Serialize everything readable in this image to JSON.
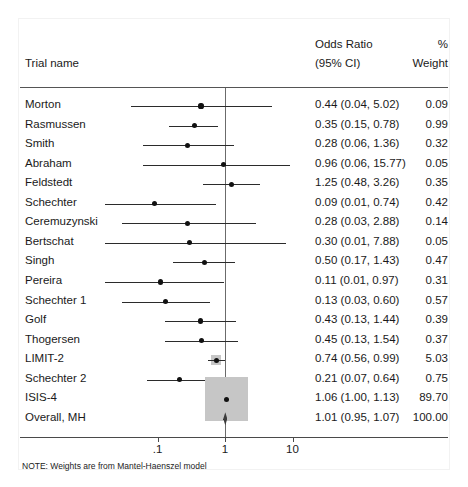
{
  "header": {
    "trial_name": "Trial name",
    "odds_ratio_line1": "Odds Ratio",
    "odds_ratio_line2": "(95% CI)",
    "weight_line1": "%",
    "weight_line2": "Weight"
  },
  "footnote": "NOTE: Weights are from Mantel-Haenszel model",
  "axis": {
    "ticks": [
      {
        "label": ".1",
        "value": 0.1
      },
      {
        "label": "1",
        "value": 1
      },
      {
        "label": "10",
        "value": 10
      }
    ]
  },
  "colors": {
    "marker": "#111111",
    "ci_line": "#2b2b2b",
    "weight_box": "#c6c6c6",
    "null_line": "#6b6b6b",
    "axis": "#4a4a4a",
    "text": "#1a1a1a",
    "background": "#ffffff"
  },
  "chart_data": {
    "type": "forest",
    "title": "",
    "xlabel": "",
    "ylabel": "",
    "xscale": "log",
    "xlim": [
      0.022,
      46
    ],
    "null_value": 1,
    "grid": false,
    "legend": "none",
    "columns": [
      "Trial name",
      "Odds Ratio (95% CI)",
      "% Weight"
    ],
    "rows": [
      {
        "trial": "Morton",
        "or": 0.44,
        "lo": 0.04,
        "hi": 5.02,
        "text": "0.44 (0.04, 5.02)",
        "weight": 0.09,
        "weight_text": "0.09",
        "box": false,
        "diamond": false
      },
      {
        "trial": "Rasmussen",
        "or": 0.35,
        "lo": 0.15,
        "hi": 0.78,
        "text": "0.35 (0.15, 0.78)",
        "weight": 0.99,
        "weight_text": "0.99",
        "box": false,
        "diamond": false
      },
      {
        "trial": "Smith",
        "or": 0.28,
        "lo": 0.06,
        "hi": 1.36,
        "text": "0.28 (0.06, 1.36)",
        "weight": 0.32,
        "weight_text": "0.32",
        "box": false,
        "diamond": false
      },
      {
        "trial": "Abraham",
        "or": 0.96,
        "lo": 0.06,
        "hi": 15.77,
        "text": "0.96 (0.06, 15.77)",
        "weight": 0.05,
        "weight_text": "0.05",
        "box": false,
        "diamond": false
      },
      {
        "trial": "Feldstedt",
        "or": 1.25,
        "lo": 0.48,
        "hi": 3.26,
        "text": "1.25 (0.48, 3.26)",
        "weight": 0.35,
        "weight_text": "0.35",
        "box": false,
        "diamond": false
      },
      {
        "trial": "Schechter",
        "or": 0.09,
        "lo": 0.01,
        "hi": 0.74,
        "text": "0.09 (0.01, 0.74)",
        "weight": 0.42,
        "weight_text": "0.42",
        "box": false,
        "diamond": false
      },
      {
        "trial": "Ceremuzynski",
        "or": 0.28,
        "lo": 0.03,
        "hi": 2.88,
        "text": "0.28 (0.03, 2.88)",
        "weight": 0.14,
        "weight_text": "0.14",
        "box": false,
        "diamond": false
      },
      {
        "trial": "Bertschat",
        "or": 0.3,
        "lo": 0.01,
        "hi": 7.88,
        "text": "0.30 (0.01, 7.88)",
        "weight": 0.05,
        "weight_text": "0.05",
        "box": false,
        "diamond": false
      },
      {
        "trial": "Singh",
        "or": 0.5,
        "lo": 0.17,
        "hi": 1.43,
        "text": "0.50 (0.17, 1.43)",
        "weight": 0.47,
        "weight_text": "0.47",
        "box": false,
        "diamond": false
      },
      {
        "trial": "Pereira",
        "or": 0.11,
        "lo": 0.01,
        "hi": 0.97,
        "text": "0.11 (0.01, 0.97)",
        "weight": 0.31,
        "weight_text": "0.31",
        "box": false,
        "diamond": false
      },
      {
        "trial": "Schechter 1",
        "or": 0.13,
        "lo": 0.03,
        "hi": 0.6,
        "text": "0.13 (0.03, 0.60)",
        "weight": 0.57,
        "weight_text": "0.57",
        "box": false,
        "diamond": false
      },
      {
        "trial": "Golf",
        "or": 0.43,
        "lo": 0.13,
        "hi": 1.44,
        "text": "0.43 (0.13, 1.44)",
        "weight": 0.39,
        "weight_text": "0.39",
        "box": false,
        "diamond": false
      },
      {
        "trial": "Thogersen",
        "or": 0.45,
        "lo": 0.13,
        "hi": 1.54,
        "text": "0.45 (0.13, 1.54)",
        "weight": 0.37,
        "weight_text": "0.37",
        "box": false,
        "diamond": false
      },
      {
        "trial": "LIMIT-2",
        "or": 0.74,
        "lo": 0.56,
        "hi": 0.99,
        "text": "0.74 (0.56, 0.99)",
        "weight": 5.03,
        "weight_text": "5.03",
        "box": true,
        "diamond": false
      },
      {
        "trial": "Schechter 2",
        "or": 0.21,
        "lo": 0.07,
        "hi": 0.64,
        "text": "0.21 (0.07, 0.64)",
        "weight": 0.75,
        "weight_text": "0.75",
        "box": false,
        "diamond": false
      },
      {
        "trial": "ISIS-4",
        "or": 1.06,
        "lo": 1.0,
        "hi": 1.13,
        "text": "1.06 (1.00, 1.13)",
        "weight": 89.7,
        "weight_text": "89.70",
        "box": true,
        "diamond": false
      },
      {
        "trial": "Overall, MH",
        "or": 1.01,
        "lo": 0.95,
        "hi": 1.07,
        "text": "1.01 (0.95, 1.07)",
        "weight": 100.0,
        "weight_text": "100.00",
        "box": false,
        "diamond": true
      }
    ]
  }
}
